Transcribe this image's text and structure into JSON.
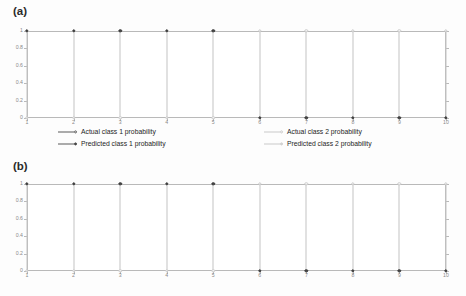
{
  "figure": {
    "background": "#fdfdfd",
    "panels": [
      {
        "id": "a",
        "label": "(a)"
      },
      {
        "id": "b",
        "label": "(b)"
      }
    ]
  },
  "legend": {
    "entries": [
      {
        "label": "Actual class 1 probability",
        "glyph": "line-open-circle-dark",
        "color": "#5a5a5a"
      },
      {
        "label": "Predicted class 1 probability",
        "glyph": "line-filled-circle-dark",
        "color": "#4a4a4a"
      },
      {
        "label": "Actual class 2 probability",
        "glyph": "line-open-circle-light",
        "color": "#cacaca"
      },
      {
        "label": "Predicted class 2 probability",
        "glyph": "line-filled-square-light",
        "color": "#d8d8d8"
      }
    ]
  },
  "chart_data": [
    {
      "type": "line",
      "panel": "a",
      "title": "(a)",
      "xlabel": "",
      "ylabel": "",
      "x": [
        1,
        2,
        3,
        4,
        5,
        6,
        7,
        8,
        9,
        10
      ],
      "xlim": [
        1,
        10
      ],
      "ylim": [
        0,
        1
      ],
      "xticks": [
        "1",
        "2",
        "3",
        "4",
        "5",
        "6",
        "7",
        "8",
        "9",
        "10"
      ],
      "yticks": [
        "0",
        "0.2",
        "0.4",
        "0.6",
        "0.8",
        "1"
      ],
      "grid": false,
      "legend_position": "below-axes",
      "series": [
        {
          "name": "Actual class 1 probability",
          "values": [
            1,
            1,
            1,
            1,
            1,
            0,
            0,
            0,
            0,
            0
          ]
        },
        {
          "name": "Predicted class 1 probability",
          "values": [
            1,
            1,
            1,
            1,
            1,
            0,
            0,
            0,
            0,
            0
          ]
        },
        {
          "name": "Actual class 2 probability",
          "values": [
            0,
            0,
            0,
            0,
            0,
            1,
            1,
            1,
            1,
            1
          ]
        },
        {
          "name": "Predicted class 2 probability",
          "values": [
            0,
            0,
            0,
            0,
            0,
            1,
            1,
            1,
            1,
            1
          ]
        }
      ]
    },
    {
      "type": "line",
      "panel": "b",
      "title": "(b)",
      "xlabel": "",
      "ylabel": "",
      "x": [
        1,
        2,
        3,
        4,
        5,
        6,
        7,
        8,
        9,
        10
      ],
      "xlim": [
        1,
        10
      ],
      "ylim": [
        0,
        1
      ],
      "xticks": [
        "1",
        "2",
        "3",
        "4",
        "5",
        "6",
        "7",
        "8",
        "9",
        "10"
      ],
      "yticks": [
        "0",
        "0.2",
        "0.4",
        "0.6",
        "0.8",
        "1"
      ],
      "grid": false,
      "legend_position": "none",
      "series": [
        {
          "name": "Actual class 1 probability",
          "values": [
            1,
            1,
            1,
            1,
            1,
            0,
            0,
            0,
            0,
            0
          ]
        },
        {
          "name": "Predicted class 1 probability",
          "values": [
            1,
            1,
            1,
            1,
            1,
            0,
            0,
            0,
            0,
            0
          ]
        },
        {
          "name": "Actual class 2 probability",
          "values": [
            0,
            0,
            0,
            0,
            0,
            1,
            1,
            1,
            1,
            1
          ]
        },
        {
          "name": "Predicted class 2 probability",
          "values": [
            0,
            0,
            0,
            0,
            0,
            1,
            1,
            1,
            1,
            1
          ]
        }
      ]
    }
  ]
}
